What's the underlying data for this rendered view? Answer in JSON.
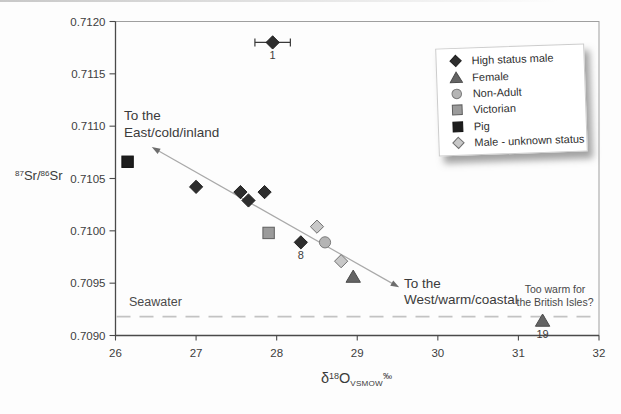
{
  "figure": {
    "y_axis_title": {
      "sup1": "87",
      "base1": "Sr/",
      "sup2": "86",
      "base2": "Sr"
    },
    "x_axis_title": {
      "base1": "δ",
      "sup1": "18",
      "base2": "O",
      "sub": "VSMOW",
      "sup2": "‰"
    }
  },
  "annotations": {
    "east": {
      "line1": "To the",
      "line2": "East/cold/inland"
    },
    "west": {
      "line1": "To the",
      "line2": "West/warm/coastal"
    },
    "too_warm": {
      "line1": "Too warm for",
      "line2": "the British Isles?"
    },
    "seawater": "Seawater"
  },
  "chart_data": {
    "type": "scatter",
    "x_axis": {
      "label": "δ18O VSMOW ‰",
      "min": 26,
      "max": 32,
      "tick_labels": [
        "26",
        "27",
        "28",
        "29",
        "30",
        "31",
        "32"
      ]
    },
    "y_axis": {
      "label": "87Sr/86Sr",
      "min": 0.709,
      "max": 0.712,
      "tick_labels": [
        "0.7120",
        "0.7115",
        "0.7110",
        "0.7105",
        "0.7100",
        "0.7095",
        "0.7090"
      ]
    },
    "grid": false,
    "legend_position": "upper right",
    "series": [
      {
        "name": "High status male",
        "marker": "diamond",
        "fill": "#2e2e2e",
        "stroke": "#1f1f1f",
        "points": [
          {
            "x": 27.95,
            "y": 0.7118,
            "label": "1",
            "x_err": 0.22
          },
          {
            "x": 27.0,
            "y": 0.71042
          },
          {
            "x": 27.55,
            "y": 0.71037
          },
          {
            "x": 27.65,
            "y": 0.71029
          },
          {
            "x": 27.85,
            "y": 0.71037
          },
          {
            "x": 28.3,
            "y": 0.70989,
            "label": "8"
          }
        ]
      },
      {
        "name": "Female",
        "marker": "triangle",
        "fill": "#646464",
        "stroke": "#4c4c4c",
        "points": [
          {
            "x": 28.95,
            "y": 0.70956
          },
          {
            "x": 31.3,
            "y": 0.70914,
            "label": "19"
          }
        ]
      },
      {
        "name": "Non-Adult",
        "marker": "circle",
        "fill": "#b4b4b4",
        "stroke": "#7a7a7a",
        "points": [
          {
            "x": 28.6,
            "y": 0.70989
          }
        ]
      },
      {
        "name": "Victorian",
        "marker": "square",
        "fill": "#9b9b9b",
        "stroke": "#5e5e5e",
        "points": [
          {
            "x": 27.9,
            "y": 0.70998
          }
        ]
      },
      {
        "name": "Pig",
        "marker": "square",
        "fill": "#1d1d1d",
        "stroke": "#111111",
        "points": [
          {
            "x": 26.15,
            "y": 0.71066
          }
        ]
      },
      {
        "name": "Male - unknown status",
        "marker": "diamond",
        "fill": "#c8c8c8",
        "stroke": "#6f6f6f",
        "points": [
          {
            "x": 28.5,
            "y": 0.71004
          },
          {
            "x": 28.8,
            "y": 0.70971
          }
        ]
      }
    ],
    "trend_arrow": {
      "x1": 26.45,
      "y1": 0.7108,
      "x2": 29.52,
      "y2": 0.70946,
      "color": "#a9a9a9",
      "head_color": "#6d6d6d"
    },
    "seawater_line": {
      "y": 0.70918,
      "color": "#c3c3c3",
      "label": "Seawater"
    }
  }
}
